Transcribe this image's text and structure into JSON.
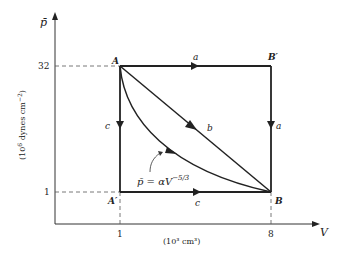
{
  "diagram": {
    "type": "p-V diagram",
    "y_axis": {
      "symbol": "p̄",
      "units_prefix": "(10",
      "units_exp": "6",
      "units_mid": " dynes  cm",
      "units_exp2": "−2",
      "units_suffix": ")",
      "ticks": [
        "32",
        "1"
      ]
    },
    "x_axis": {
      "symbol": "V",
      "units": "(10³  cm³)",
      "ticks": [
        "1",
        "8"
      ]
    },
    "points": {
      "A": "A",
      "B": "B",
      "A_prime": "A′",
      "B_prime": "B′"
    },
    "path_labels": {
      "a_top": "a",
      "a_right": "a",
      "b_diag": "b",
      "c_left": "c",
      "c_bottom": "c"
    },
    "curve_equation": {
      "lhs": "p̄ = αV",
      "exponent": "−5/3"
    },
    "colors": {
      "line": "#222222",
      "dashed": "#555555"
    }
  }
}
